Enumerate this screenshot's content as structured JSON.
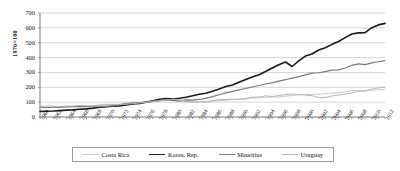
{
  "chart_data": {
    "type": "line",
    "title": "",
    "subtitle": "",
    "xlabel": "",
    "ylabel": "1976=100",
    "xlim": [
      1960,
      2012
    ],
    "ylim": [
      0,
      700
    ],
    "yticks": [
      0,
      100,
      200,
      300,
      400,
      500,
      600,
      700
    ],
    "grid": "horizontal",
    "legend_position": "bottom",
    "x": [
      1960,
      1961,
      1962,
      1963,
      1964,
      1965,
      1966,
      1967,
      1968,
      1969,
      1970,
      1971,
      1972,
      1973,
      1974,
      1975,
      1976,
      1977,
      1978,
      1979,
      1980,
      1981,
      1982,
      1983,
      1984,
      1985,
      1986,
      1987,
      1988,
      1989,
      1990,
      1991,
      1992,
      1993,
      1994,
      1995,
      1996,
      1997,
      1998,
      1999,
      2000,
      2001,
      2002,
      2003,
      2004,
      2005,
      2006,
      2007,
      2008,
      2009,
      2010,
      2011,
      2012
    ],
    "xtick_labels": [
      "1960",
      "1962",
      "1964",
      "1966",
      "1968",
      "1970",
      "1972",
      "1974",
      "1976",
      "1978",
      "1980",
      "1982",
      "1984",
      "1986",
      "1988",
      "1990",
      "1992",
      "1994",
      "1996",
      "1998",
      "2000",
      "2002",
      "2004",
      "2006",
      "2008",
      "2010",
      "2012"
    ],
    "series": [
      {
        "name": "Costa Rica",
        "color": "#c9c9c9",
        "width": 1.0,
        "values": [
          62,
          63,
          65,
          66,
          68,
          71,
          73,
          75,
          77,
          78,
          80,
          83,
          87,
          91,
          93,
          94,
          100,
          105,
          109,
          111,
          110,
          105,
          99,
          98,
          102,
          103,
          107,
          110,
          112,
          117,
          119,
          120,
          126,
          130,
          133,
          135,
          135,
          140,
          145,
          150,
          152,
          151,
          153,
          157,
          160,
          163,
          170,
          177,
          178,
          175,
          180,
          183,
          186
        ]
      },
      {
        "name": "Korea, Rep.",
        "color": "#1a1a1a",
        "width": 1.6,
        "values": [
          38,
          39,
          40,
          43,
          46,
          48,
          52,
          55,
          60,
          66,
          69,
          72,
          75,
          81,
          87,
          91,
          100,
          110,
          119,
          125,
          120,
          126,
          133,
          143,
          153,
          160,
          173,
          189,
          205,
          216,
          234,
          253,
          269,
          285,
          306,
          330,
          352,
          370,
          340,
          378,
          410,
          424,
          451,
          466,
          489,
          508,
          534,
          559,
          566,
          568,
          601,
          620,
          630
        ]
      },
      {
        "name": "Mauritius",
        "color": "#7a7a7a",
        "width": 1.2,
        "values": [
          66,
          64,
          66,
          67,
          68,
          70,
          71,
          70,
          69,
          70,
          72,
          74,
          82,
          90,
          96,
          97,
          100,
          108,
          112,
          117,
          112,
          109,
          115,
          114,
          118,
          125,
          137,
          150,
          162,
          172,
          183,
          192,
          202,
          212,
          222,
          230,
          241,
          251,
          262,
          272,
          283,
          295,
          298,
          306,
          315,
          317,
          330,
          348,
          357,
          353,
          364,
          372,
          380
        ]
      },
      {
        "name": "Uruguay",
        "color": "#b4b4b4",
        "width": 1.0,
        "values": [
          73,
          74,
          72,
          71,
          74,
          74,
          78,
          75,
          76,
          81,
          86,
          85,
          84,
          86,
          90,
          94,
          100,
          102,
          108,
          114,
          118,
          116,
          105,
          102,
          101,
          102,
          110,
          117,
          118,
          119,
          120,
          125,
          134,
          134,
          142,
          138,
          144,
          151,
          155,
          151,
          148,
          143,
          130,
          131,
          141,
          148,
          154,
          162,
          173,
          175,
          188,
          196,
          200
        ]
      }
    ]
  },
  "legend": {
    "items": [
      {
        "label": "Costa Rica"
      },
      {
        "label": "Korea, Rep."
      },
      {
        "label": "Mauritius"
      },
      {
        "label": "Uruguay"
      }
    ]
  }
}
